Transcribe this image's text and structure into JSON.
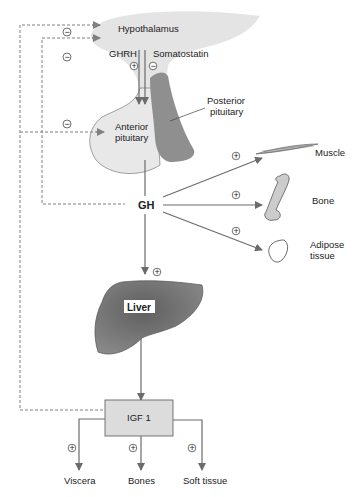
{
  "diagram": {
    "nodes": {
      "hypothalamus": "Hypothalamus",
      "ghrh": "GHRH",
      "somatostatin": "Somatostatin",
      "anterior_pituitary_line1": "Anterior",
      "anterior_pituitary_line2": "pituitary",
      "posterior_pituitary_line1": "Posterior",
      "posterior_pituitary_line2": "pituitary",
      "gh": "GH",
      "muscle": "Muscle",
      "bone": "Bone",
      "adipose_line1": "Adipose",
      "adipose_line2": "tissue",
      "liver": "Liver",
      "igf1": "IGF 1",
      "viscera": "Viscera",
      "bones": "Bones",
      "soft_tissue": "Soft tissue"
    },
    "signs": {
      "plus": "+",
      "minus": "−"
    },
    "colors": {
      "arrow": "#6b6b6b",
      "dashed": "#808080",
      "hypothalamus_fill": "#e4e4e4",
      "anterior_fill": "#e8e8e8",
      "posterior_fill": "#8f8f8f",
      "liver_fill": "#7a7a7a",
      "igf_fill": "#dcdcdc"
    }
  }
}
